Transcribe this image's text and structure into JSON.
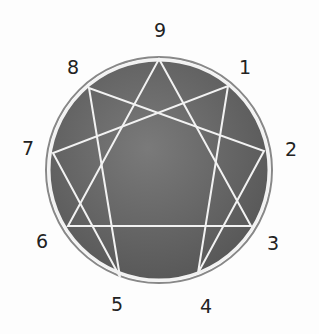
{
  "diagram": {
    "type": "enneagram",
    "circle": {
      "cx": 159,
      "cy": 170,
      "r": 111,
      "fill": "#6e6e6e",
      "stroke": "#f0f0f0"
    },
    "points": [
      {
        "id": "9",
        "x": 159,
        "y": 59
      },
      {
        "id": "1",
        "x": 228,
        "y": 86
      },
      {
        "id": "2",
        "x": 264,
        "y": 151
      },
      {
        "id": "3",
        "x": 251,
        "y": 226
      },
      {
        "id": "4",
        "x": 198,
        "y": 273
      },
      {
        "id": "5",
        "x": 120,
        "y": 277
      },
      {
        "id": "6",
        "x": 68,
        "y": 226
      },
      {
        "id": "7",
        "x": 53,
        "y": 153
      },
      {
        "id": "8",
        "x": 89,
        "y": 88
      }
    ],
    "triangle": [
      "9",
      "3",
      "6"
    ],
    "hexad": [
      "1",
      "4",
      "2",
      "8",
      "5",
      "7"
    ],
    "labels": [
      {
        "text": "9",
        "x": 160,
        "y": 30
      },
      {
        "text": "1",
        "x": 245,
        "y": 67
      },
      {
        "text": "2",
        "x": 291,
        "y": 149
      },
      {
        "text": "3",
        "x": 273,
        "y": 243
      },
      {
        "text": "4",
        "x": 206,
        "y": 306
      },
      {
        "text": "5",
        "x": 117,
        "y": 304
      },
      {
        "text": "6",
        "x": 42,
        "y": 241
      },
      {
        "text": "7",
        "x": 28,
        "y": 148
      },
      {
        "text": "8",
        "x": 73,
        "y": 67
      }
    ]
  }
}
